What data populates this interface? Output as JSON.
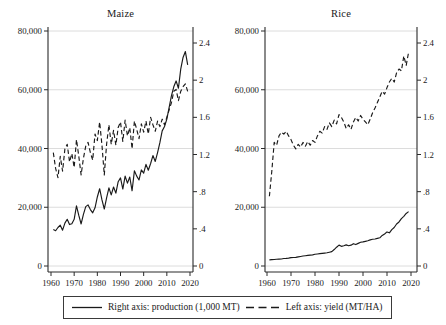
{
  "figure": {
    "background": "#ffffff",
    "line_color": "#1a1a1a",
    "grid_color": "#d8d8d8",
    "axis_color": "#2a2a2a"
  },
  "legend": {
    "production_label": "Right axis: production (1,000 MT)",
    "yield_label": "Left axis: yield (MT/HA)",
    "production_style": "solid",
    "yield_style": "dashed"
  },
  "chart_data": [
    {
      "type": "line",
      "title": "Maize",
      "x_tick_labels": [
        "1960",
        "1970",
        "1980",
        "1990",
        "2000",
        "2010",
        "2020"
      ],
      "x_tick_values": [
        1960,
        1970,
        1980,
        1990,
        2000,
        2010,
        2020
      ],
      "left_axis": {
        "ylim": [
          0,
          80000
        ],
        "tick_labels": [
          "80,000",
          "60,000",
          "40,000",
          "20,000",
          "0"
        ],
        "tick_values": [
          80000,
          60000,
          40000,
          20000,
          0
        ],
        "grid": true
      },
      "right_axis": {
        "ylim": [
          0,
          2.4
        ],
        "tick_labels": [
          "2.4",
          "2",
          "1.6",
          "1.2",
          ".8",
          ".4",
          "0"
        ],
        "tick_values": [
          2.4,
          2,
          1.6,
          1.2,
          0.8,
          0.4,
          0
        ],
        "grid": false
      },
      "x_years": [
        1961,
        1962,
        1963,
        1964,
        1965,
        1966,
        1967,
        1968,
        1969,
        1970,
        1971,
        1972,
        1973,
        1974,
        1975,
        1976,
        1977,
        1978,
        1979,
        1980,
        1981,
        1982,
        1983,
        1984,
        1985,
        1986,
        1987,
        1988,
        1989,
        1990,
        1991,
        1992,
        1993,
        1994,
        1995,
        1996,
        1997,
        1998,
        1999,
        2000,
        2001,
        2002,
        2003,
        2004,
        2005,
        2006,
        2007,
        2008,
        2009,
        2010,
        2011,
        2012,
        2013,
        2014,
        2015,
        2016,
        2017,
        2018,
        2019
      ],
      "series": [
        {
          "name": "production",
          "units": "1,000 MT",
          "scale": "thousand_mt",
          "style": "solid",
          "values": [
            12400,
            12000,
            13100,
            13900,
            12200,
            14600,
            15900,
            14100,
            14400,
            15900,
            20500,
            17200,
            14300,
            17600,
            20200,
            20800,
            19200,
            18100,
            19800,
            23500,
            26300,
            22500,
            19400,
            23200,
            26600,
            24200,
            26900,
            24800,
            28700,
            30000,
            26200,
            30600,
            28200,
            30300,
            25600,
            32400,
            30600,
            29300,
            32700,
            31600,
            34600,
            32600,
            34900,
            37600,
            35600,
            38600,
            42000,
            46000,
            47500,
            50000,
            54000,
            58000,
            61000,
            63000,
            60500,
            67000,
            71000,
            73000,
            68500
          ]
        },
        {
          "name": "yield",
          "units": "MT/HA",
          "scale": "mt_per_ha",
          "style": "dashed",
          "values": [
            1.22,
            1.05,
            0.95,
            1.18,
            1.02,
            1.26,
            1.31,
            1.12,
            1.21,
            1.06,
            1.36,
            1.18,
            0.98,
            1.16,
            1.29,
            1.33,
            1.22,
            1.14,
            1.42,
            1.35,
            1.55,
            1.3,
            0.98,
            1.31,
            1.52,
            1.31,
            1.46,
            1.3,
            1.49,
            1.55,
            1.34,
            1.57,
            1.4,
            1.49,
            1.26,
            1.56,
            1.47,
            1.37,
            1.53,
            1.44,
            1.56,
            1.42,
            1.6,
            1.52,
            1.45,
            1.56,
            1.5,
            1.58,
            1.52,
            1.6,
            1.68,
            1.76,
            1.88,
            1.9,
            1.78,
            1.88,
            1.93,
            1.96,
            1.88
          ]
        }
      ]
    },
    {
      "type": "line",
      "title": "Rice",
      "x_tick_labels": [
        "1960",
        "1970",
        "1980",
        "1990",
        "2000",
        "2010",
        "2020"
      ],
      "x_tick_values": [
        1960,
        1970,
        1980,
        1990,
        2000,
        2010,
        2020
      ],
      "left_axis": {
        "ylim": [
          0,
          80000
        ],
        "tick_labels": [
          "80,000",
          "60,000",
          "40,000",
          "20,000",
          "0"
        ],
        "tick_values": [
          80000,
          60000,
          40000,
          20000,
          0
        ],
        "grid": true
      },
      "right_axis": {
        "ylim": [
          0,
          2.4
        ],
        "tick_labels": [
          "2.4",
          "2",
          "1.6",
          "1.2",
          ".8",
          ".4",
          "0"
        ],
        "tick_values": [
          2.4,
          2,
          1.6,
          1.2,
          0.8,
          0.4,
          0
        ],
        "grid": false
      },
      "x_years": [
        1961,
        1962,
        1963,
        1964,
        1965,
        1966,
        1967,
        1968,
        1969,
        1970,
        1971,
        1972,
        1973,
        1974,
        1975,
        1976,
        1977,
        1978,
        1979,
        1980,
        1981,
        1982,
        1983,
        1984,
        1985,
        1986,
        1987,
        1988,
        1989,
        1990,
        1991,
        1992,
        1993,
        1994,
        1995,
        1996,
        1997,
        1998,
        1999,
        2000,
        2001,
        2002,
        2003,
        2004,
        2005,
        2006,
        2007,
        2008,
        2009,
        2010,
        2011,
        2012,
        2013,
        2014,
        2015,
        2016,
        2017,
        2018,
        2019
      ],
      "series": [
        {
          "name": "production",
          "units": "1,000 MT",
          "scale": "thousand_mt",
          "style": "solid",
          "values": [
            2100,
            2150,
            2200,
            2300,
            2350,
            2400,
            2550,
            2600,
            2700,
            2850,
            2900,
            2950,
            3100,
            3250,
            3400,
            3500,
            3600,
            3700,
            3800,
            4000,
            4100,
            4200,
            4300,
            4400,
            4500,
            4700,
            4900,
            5600,
            6400,
            7100,
            6700,
            6900,
            7200,
            6900,
            7100,
            7600,
            7300,
            7700,
            8100,
            8200,
            8400,
            8600,
            8900,
            9100,
            9200,
            9400,
            9600,
            10400,
            10900,
            11600,
            11300,
            12400,
            13100,
            14300,
            15000,
            16100,
            16900,
            17900,
            18500
          ]
        },
        {
          "name": "yield",
          "units": "MT/HA",
          "scale": "mt_per_ha",
          "style": "dashed",
          "values": [
            0.75,
            1.02,
            1.33,
            1.3,
            1.4,
            1.44,
            1.42,
            1.45,
            1.4,
            1.36,
            1.3,
            1.26,
            1.31,
            1.28,
            1.33,
            1.29,
            1.34,
            1.3,
            1.35,
            1.33,
            1.4,
            1.45,
            1.43,
            1.5,
            1.47,
            1.54,
            1.5,
            1.57,
            1.53,
            1.63,
            1.6,
            1.55,
            1.48,
            1.52,
            1.47,
            1.55,
            1.6,
            1.56,
            1.62,
            1.58,
            1.55,
            1.52,
            1.58,
            1.65,
            1.7,
            1.76,
            1.82,
            1.88,
            1.85,
            1.92,
            1.98,
            2.02,
            1.98,
            2.08,
            2.12,
            2.1,
            2.26,
            2.16,
            2.3
          ]
        }
      ]
    }
  ]
}
